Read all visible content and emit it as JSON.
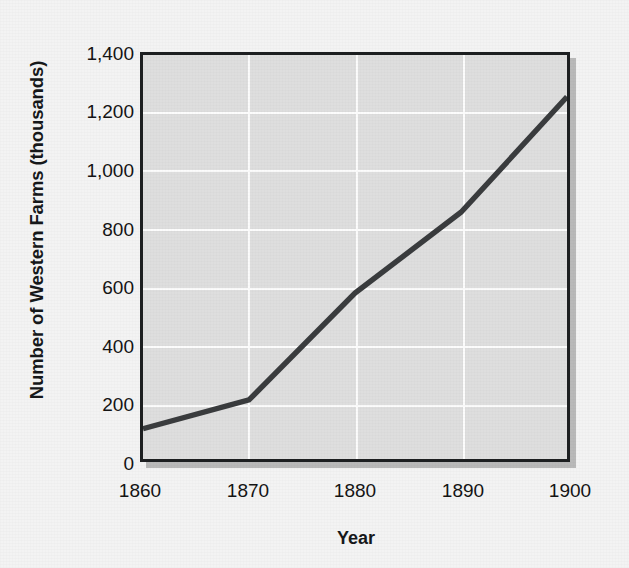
{
  "chart_data": {
    "type": "line",
    "title": "",
    "xlabel": "Year",
    "ylabel": "Number of Western Farms (thousands)",
    "x": [
      1860,
      1870,
      1880,
      1890,
      1900
    ],
    "values": [
      105,
      205,
      575,
      855,
      1255
    ],
    "series": [
      {
        "name": "Number of Western Farms",
        "values": [
          105,
          205,
          575,
          855,
          1255
        ]
      }
    ],
    "xlim": [
      1860,
      1900
    ],
    "ylim": [
      0,
      1400
    ],
    "xticks": [
      1860,
      1870,
      1880,
      1890,
      1900
    ],
    "xtick_labels": [
      "1860",
      "1870",
      "1880",
      "1890",
      "1900"
    ],
    "yticks": [
      0,
      200,
      400,
      600,
      800,
      1000,
      1200,
      1400
    ],
    "ytick_labels": [
      "0",
      "200",
      "400",
      "600",
      "800",
      "1,000",
      "1,200",
      "1,400"
    ],
    "grid": true,
    "legend": null,
    "annotations": [],
    "colors": {
      "line": "#3a3c3e",
      "plot_background": "#dedede",
      "figure_background": "#f3f3f3",
      "gridline": "#fcfcfc",
      "frame": "#1d1f21",
      "shadow": "#b9b9b9",
      "text": "#141414"
    }
  }
}
